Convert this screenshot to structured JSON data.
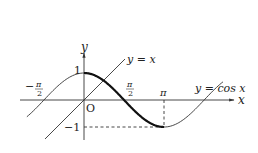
{
  "diagram": {
    "axes": {
      "x_label": "x",
      "y_label": "y",
      "origin_label": "O"
    },
    "ticks": {
      "x": [
        {
          "label": "-π/2",
          "value": -1.5708
        },
        {
          "label": "π/2",
          "value": 1.5708
        },
        {
          "label": "π",
          "value": 3.1416
        }
      ],
      "y": [
        {
          "label": "1",
          "value": 1
        },
        {
          "label": "-1",
          "value": -1
        }
      ]
    },
    "curves": [
      {
        "name": "cosine",
        "label": "y = cos x",
        "equation": "cos x",
        "x_range": [
          -2.24,
          5.45
        ],
        "bold_segment": [
          0,
          3.1416
        ]
      },
      {
        "name": "identity-line",
        "label": "y = x",
        "equation": "x",
        "x_range": [
          -1.5,
          1.58
        ]
      }
    ],
    "guides": [
      {
        "type": "dashed-vertical",
        "at_x": "π",
        "from_y": 0,
        "to_y": -1
      },
      {
        "type": "dashed-horizontal",
        "at_y": -1,
        "from_x": 0,
        "to_x": "π"
      }
    ],
    "text": {
      "y_eq_x": "y = x",
      "y_eq_cos": "y = cos x",
      "neg_pi_half_minus": "−",
      "pi_sym": "π",
      "two": "2",
      "pi": "π",
      "one": "1",
      "neg_one": "−1",
      "origin": "O",
      "x": "x",
      "y": "y"
    }
  }
}
